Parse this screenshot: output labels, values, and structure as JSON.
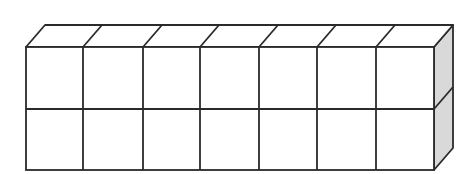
{
  "figure": {
    "cubes_long": 7,
    "cubes_high": 2,
    "cubes_deep": 1,
    "total_cubes": 14,
    "colors": {
      "stroke": "#2a2a2a",
      "front_face": "#ffffff",
      "top_face": "#ffffff",
      "side_face": "#d9d9d9"
    }
  },
  "geometry": {
    "front_left": 26,
    "front_right": 434,
    "front_top": 47,
    "front_mid": 109,
    "front_bottom": 170,
    "depth_dx": 19,
    "depth_dy": -22,
    "columns_x": [
      26,
      83,
      143,
      200,
      259,
      317,
      376,
      434
    ]
  }
}
